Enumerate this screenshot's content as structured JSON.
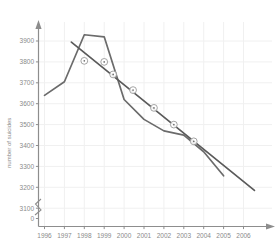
{
  "chart_data": {
    "type": "line",
    "title": "",
    "xlabel": "",
    "ylabel": "number of suicides",
    "xlim": [
      1995.4,
      2006.9
    ],
    "ylim": [
      3080,
      3960
    ],
    "grid": true,
    "legend_position": "none",
    "axis_break": true,
    "axis_break_note": "y-axis broken between 0 and 3100",
    "x_tick_labels": [
      "1996",
      "1997",
      "1998",
      "1999",
      "2000",
      "2001",
      "2002",
      "2003",
      "2004",
      "2005",
      "2006"
    ],
    "y_tick_labels": [
      "0",
      "3100",
      "3200",
      "3300",
      "3400",
      "3500",
      "3600",
      "3700",
      "3800",
      "3900"
    ],
    "categories": [
      1996,
      1997,
      1998,
      1999,
      2000,
      2001,
      2002,
      2003,
      2004,
      2005
    ],
    "series": [
      {
        "name": "number of suicides",
        "type": "line",
        "color": "#6b6b6b",
        "marker": "none",
        "x": [
          1996,
          1997,
          1998,
          1999,
          2000,
          2001,
          2002,
          2003,
          2004,
          2005
        ],
        "values": [
          3640,
          3705,
          3930,
          3920,
          3620,
          3525,
          3470,
          3450,
          3370,
          3255
        ]
      },
      {
        "name": "linear trend",
        "type": "line",
        "color": "#5a5a5a",
        "marker": "circle-dot",
        "x": [
          1997.35,
          2006.55
        ],
        "values": [
          3895,
          3185
        ],
        "marker_points": [
          {
            "x": 1998.0,
            "y": 3805
          },
          {
            "x": 1999.0,
            "y": 3800
          },
          {
            "x": 1999.45,
            "y": 3740
          },
          {
            "x": 2000.45,
            "y": 3665
          },
          {
            "x": 2001.5,
            "y": 3580
          },
          {
            "x": 2002.5,
            "y": 3500
          },
          {
            "x": 2003.5,
            "y": 3420
          }
        ]
      }
    ]
  },
  "axes": {
    "y_axis_label": "number of suicides",
    "x_axis_arrow": "arrow-right",
    "y_axis_arrow": "arrow-up",
    "break_symbol": "axis-break"
  },
  "colors": {
    "data_line": "#6b6b6b",
    "trend_line": "#5a5a5a",
    "axis": "#8d8d8d",
    "grid": "#f0f0f0",
    "text": "#8a8a8a",
    "background": "#ffffff"
  }
}
